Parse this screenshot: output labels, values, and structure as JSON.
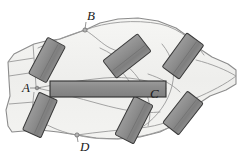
{
  "figure": {
    "type": "anatomical-diagram",
    "width": 239,
    "height": 157,
    "background_color": "#ffffff"
  },
  "colors": {
    "outline_stroke": "#8c8c8c",
    "inner_stroke": "#9a9a9a",
    "tissue_fill_light": "#f2f2f0",
    "tissue_fill_mid": "#e8e8e6",
    "block_fill": "#8f8f8f",
    "block_fill_dark": "#7d7d7d",
    "block_stroke": "#3a3a3a",
    "bar_fill": "#8a8a8a",
    "bar_stroke": "#2e2e2e",
    "label_color": "#1a1a1a",
    "marker_fill": "#b5b5b5",
    "marker_stroke": "#6d6d6d"
  },
  "labels": [
    {
      "id": "label-a",
      "text": "A",
      "x": 22,
      "y": 89,
      "marker_x": 37,
      "marker_y": 88
    },
    {
      "id": "label-b",
      "text": "B",
      "x": 87,
      "y": 17,
      "marker_x": 85,
      "marker_y": 30
    },
    {
      "id": "label-c",
      "text": "C",
      "x": 150,
      "y": 95,
      "marker_x": 0,
      "marker_y": 0
    },
    {
      "id": "label-d",
      "text": "D",
      "x": 80,
      "y": 148,
      "marker_x": 77,
      "marker_y": 135
    }
  ],
  "markers": [
    {
      "id": "marker-b",
      "x": 85,
      "y": 30,
      "r": 2.1
    },
    {
      "id": "marker-d",
      "x": 77,
      "y": 135,
      "r": 2.1
    },
    {
      "id": "marker-a",
      "x": 37,
      "y": 88,
      "r": 1.8
    }
  ],
  "blocks": [
    {
      "id": "block-upper-left",
      "cx": 47,
      "cy": 60,
      "w": 20,
      "h": 41,
      "rotate": 28,
      "fill": "#8f8f8f"
    },
    {
      "id": "block-lower-left",
      "cx": 40,
      "cy": 115,
      "w": 20,
      "h": 41,
      "rotate": 24,
      "fill": "#8f8f8f"
    },
    {
      "id": "block-upper-mid",
      "cx": 127,
      "cy": 56,
      "w": 22,
      "h": 44,
      "rotate": 52,
      "fill": "#8a8a8a"
    },
    {
      "id": "block-upper-right",
      "cx": 183,
      "cy": 56,
      "w": 21,
      "h": 42,
      "rotate": 36,
      "fill": "#8a8a8a"
    },
    {
      "id": "block-lower-mid",
      "cx": 134,
      "cy": 120,
      "w": 21,
      "h": 43,
      "rotate": 27,
      "fill": "#8a8a8a"
    },
    {
      "id": "block-lower-right",
      "cx": 183,
      "cy": 113,
      "w": 20,
      "h": 40,
      "rotate": 38,
      "fill": "#8a8a8a"
    }
  ],
  "center_bar": {
    "id": "center-bar",
    "x": 50,
    "y": 81,
    "width": 116,
    "height": 16,
    "fill": "#8a8a8a",
    "stroke": "#2e2e2e"
  },
  "outline_path": "M 8,62 L 14,54 L 34,44 L 46,41 L 60,39 L 74,34 L 85,30 L 100,23 L 118,19 L 138,18 L 158,21 L 176,28 L 190,38 L 200,49 L 212,57 L 228,64 L 236,70 L 236,84 L 226,90 L 210,96 L 198,104 L 188,114 L 176,124 L 160,132 L 140,137 L 118,139 L 96,138 L 77,135 L 58,132 L 40,130 L 24,131 L 12,132 L 8,126 L 6,110 L 10,96 L 9,80 Z",
  "inner_curves": [
    {
      "id": "curve-top-1",
      "d": "M 85,30 C 105,22 135,19 160,24 C 182,29 196,44 204,55"
    },
    {
      "id": "curve-top-2",
      "d": "M 85,30 C 95,36 102,44 110,48 C 122,54 136,55 148,50"
    },
    {
      "id": "curve-top-3",
      "d": "M 38,48 C 56,40 72,34 85,30"
    },
    {
      "id": "curve-mid-1",
      "d": "M 37,88 C 58,84 82,80 104,78 C 128,76 150,80 166,88"
    },
    {
      "id": "curve-mid-2",
      "d": "M 37,88 C 56,92 78,98 100,104 C 122,110 142,114 160,112"
    },
    {
      "id": "curve-mid-3",
      "d": "M 100,48 C 118,56 134,70 142,84 C 150,98 152,112 148,126"
    },
    {
      "id": "curve-mid-4",
      "d": "M 162,44 C 172,56 176,70 172,86 C 168,102 158,116 144,126"
    },
    {
      "id": "curve-bot-1",
      "d": "M 77,135 C 98,132 120,130 140,128 C 160,126 176,120 188,110"
    },
    {
      "id": "curve-bot-2",
      "d": "M 77,135 C 95,140 120,140 142,136 C 166,131 184,122 196,110"
    },
    {
      "id": "curve-bot-3",
      "d": "M 38,120 C 52,128 64,133 77,135"
    },
    {
      "id": "curve-rib-1",
      "d": "M 110,60 C 124,72 134,86 138,100"
    },
    {
      "id": "curve-rib-2",
      "d": "M 148,74 C 160,78 172,84 180,92"
    },
    {
      "id": "curve-lobe-r",
      "d": "M 196,60 C 212,64 226,70 236,76 C 226,84 210,92 196,98"
    }
  ],
  "left_segment_lines": [
    {
      "id": "left-line-1",
      "d": "M 8,62 L 34,58"
    },
    {
      "id": "left-line-2",
      "d": "M 9,76 L 36,72"
    },
    {
      "id": "left-line-3",
      "d": "M 9,104 L 34,102"
    },
    {
      "id": "left-line-4",
      "d": "M 33,44 L 36,86"
    },
    {
      "id": "left-line-5",
      "d": "M 34,92 L 30,130"
    }
  ]
}
